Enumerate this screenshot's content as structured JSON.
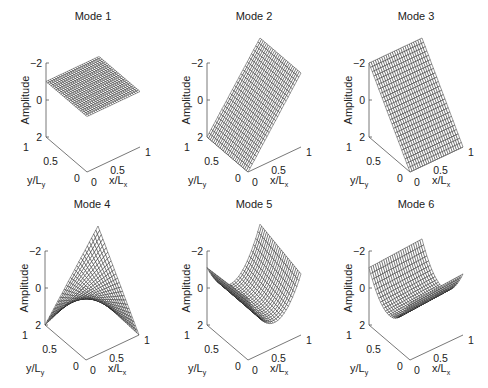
{
  "figure": {
    "width": 488,
    "height": 388,
    "background": "#ffffff",
    "mesh_fill": "#ffffff",
    "mesh_stroke": "#1a1a1a",
    "axis_color": "#555555"
  },
  "chart_data": {
    "type": "surface-3d-grid",
    "layout": {
      "rows": 2,
      "cols": 3
    },
    "shared_axes": {
      "xlabel": "x/L",
      "xlabel_sub": "x",
      "ylabel": "y/L",
      "ylabel_sub": "y",
      "zlabel": "Amplitude",
      "xlim": [
        0,
        1
      ],
      "ylim": [
        0,
        1
      ],
      "zlim": [
        -2,
        2
      ],
      "xticks": [
        "0",
        "0.5",
        "1"
      ],
      "yticks": [
        "0",
        "0.5",
        "1"
      ],
      "zticks": [
        "−2",
        "0",
        "2"
      ],
      "grid_resolution": 25
    },
    "panels": [
      {
        "title": "Mode 1",
        "surface": "constant",
        "formula": "z = 1",
        "origin": [
          87,
          172
        ]
      },
      {
        "title": "Mode 2",
        "surface": "linear in x",
        "formula": "z = 4x - 2",
        "origin": [
          248,
          172
        ]
      },
      {
        "title": "Mode 3",
        "surface": "linear in y",
        "formula": "z = 4y - 2",
        "origin": [
          410,
          172
        ]
      },
      {
        "title": "Mode 4",
        "surface": "twist",
        "formula": "z = 2(2x-1)(2y-1)",
        "origin": [
          86,
          360
        ]
      },
      {
        "title": "Mode 5",
        "surface": "quadratic in x",
        "formula": "z = 1.3(1-6x+6x^2) + 0.5y(2x-1)+0.3y",
        "origin": [
          248,
          360
        ]
      },
      {
        "title": "Mode 6",
        "surface": "quadratic in y",
        "formula": "z = 1.1(1-6y+6y^2) + 0.2x",
        "origin": [
          410,
          360
        ]
      }
    ]
  }
}
